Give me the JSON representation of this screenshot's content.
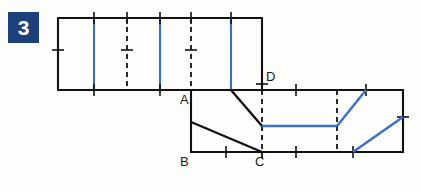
{
  "figure": {
    "exercise_number": "3",
    "badge_color": "#1d3f7a",
    "badge_text_color": "#ffffff",
    "line_color_black": "#111111",
    "line_color_blue": "#3a6fc4",
    "background_color": "#fdfdfc",
    "vertex_labels": [
      {
        "id": "A",
        "text": "A",
        "x": 180,
        "y": 93
      },
      {
        "id": "B",
        "text": "B",
        "x": 180,
        "y": 155
      },
      {
        "id": "C",
        "text": "C",
        "x": 255,
        "y": 155
      },
      {
        "id": "D",
        "text": "D",
        "x": 266,
        "y": 70
      }
    ],
    "upper_band": {
      "left": 58,
      "top": 18,
      "right": 262,
      "bottom": 90,
      "blue_verticals_x": [
        94,
        160,
        231
      ],
      "dashed_verticals_x": [
        127,
        191
      ],
      "tick_marks_top_x": [
        94,
        127,
        160,
        191,
        231
      ],
      "tick_marks_bottom_x": [
        94,
        160
      ],
      "tick_mark_left_y": 50
    },
    "lower_band": {
      "left": 191,
      "top": 90,
      "right": 403,
      "bottom": 152,
      "dashed_verticals_x": [
        262,
        337
      ],
      "tick_marks_top_x": [
        296,
        366
      ],
      "tick_marks_bottom_x": [
        226,
        296,
        353
      ],
      "tick_mark_right_y": 117
    },
    "black_diagonals": [
      {
        "x1": 191,
        "y1": 122,
        "x2": 262,
        "y2": 152
      },
      {
        "x1": 231,
        "y1": 90,
        "x2": 262,
        "y2": 126
      }
    ],
    "blue_segments": [
      {
        "x1": 262,
        "y1": 126,
        "x2": 337,
        "y2": 126
      },
      {
        "x1": 337,
        "y1": 126,
        "x2": 366,
        "y2": 90
      },
      {
        "x1": 353,
        "y1": 152,
        "x2": 403,
        "y2": 117
      }
    ]
  }
}
